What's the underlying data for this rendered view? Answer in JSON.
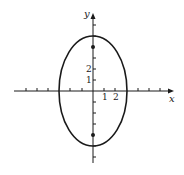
{
  "figure": {
    "type": "ellipse-graph",
    "equation_semantics": "x^2/9 + y^2/25 = 1",
    "ink_color": "#1a1a1a",
    "background_color": "#ffffff"
  },
  "axes": {
    "x_label": "x",
    "y_label": "y",
    "x_tick_labels": [
      "1",
      "2"
    ],
    "y_tick_labels": [
      "1",
      "2"
    ],
    "x_range": [
      -7,
      7
    ],
    "y_range": [
      -7,
      7
    ],
    "tick_spacing_units": 1
  },
  "ellipse": {
    "center": [
      0,
      0
    ],
    "semi_axis_x": 3,
    "semi_axis_y": 5,
    "major_axis": "vertical"
  },
  "points": [
    {
      "name": "focus-upper",
      "x": 0,
      "y": 4
    },
    {
      "name": "focus-lower",
      "x": 0,
      "y": -4
    }
  ]
}
